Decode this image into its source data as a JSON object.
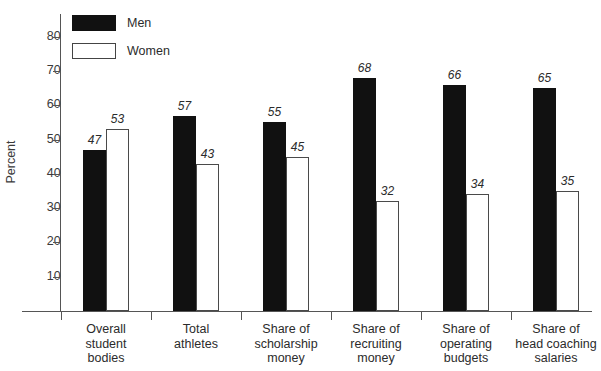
{
  "chart_data": {
    "type": "bar",
    "title": "",
    "xlabel": "",
    "ylabel": "Percent",
    "ylim": [
      0,
      85
    ],
    "grid": false,
    "legend_position": "top-left",
    "categories": [
      "Overall\nstudent\nbodies",
      "Total\nathletes",
      "Share of\nscholarship\nmoney",
      "Share of\nrecruiting\nmoney",
      "Share of\noperating\nbudgets",
      "Share of\nhead coaching\nsalaries"
    ],
    "series": [
      {
        "name": "Men",
        "color": "#111111",
        "values": [
          47,
          57,
          55,
          68,
          66,
          65
        ]
      },
      {
        "name": "Women",
        "color": "#ffffff",
        "values": [
          53,
          43,
          45,
          32,
          34,
          35
        ]
      }
    ],
    "yticks": [
      10,
      20,
      30,
      40,
      50,
      60,
      70,
      80
    ],
    "ytick_labels": [
      "10",
      "20",
      "30",
      "40",
      "50",
      "60",
      "70",
      "80"
    ],
    "value_labels": {
      "men": [
        "47",
        "57",
        "55",
        "68",
        "66",
        "65"
      ],
      "women": [
        "53",
        "43",
        "45",
        "32",
        "34",
        "35"
      ]
    }
  },
  "legend": {
    "items": [
      {
        "label": "Men",
        "style": "filled"
      },
      {
        "label": "Women",
        "style": "hollow"
      }
    ]
  },
  "axis": {
    "y_title": "Percent"
  }
}
